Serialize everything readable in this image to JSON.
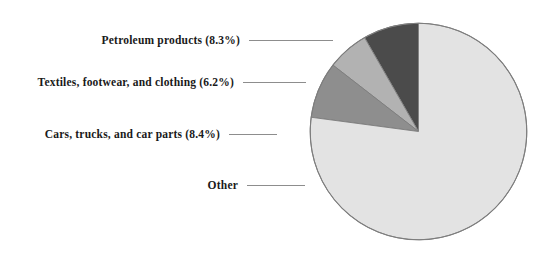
{
  "chart_data": {
    "type": "pie",
    "title": "",
    "subtitle": "",
    "xlabel": "",
    "ylabel": "",
    "legend_position": "left-labels-with-leader-lines",
    "grid": false,
    "start_angle_deg": 90,
    "direction": "counterclockwise",
    "categories": [
      "Petroleum products",
      "Textiles, footwear, and clothing",
      "Cars, trucks, and car parts",
      "Other"
    ],
    "values": [
      8.3,
      6.2,
      8.4,
      77.1
    ],
    "units": "percent",
    "slices": [
      {
        "name": "Petroleum products",
        "label": "Petroleum products (8.3%)",
        "value": 8.3,
        "value_text": "8.3%",
        "color": "#4b4b4b"
      },
      {
        "name": "Textiles, footwear, and clothing",
        "label": "Textiles, footwear, and clothing (6.2%)",
        "value": 6.2,
        "value_text": "6.2%",
        "color": "#b2b2b2"
      },
      {
        "name": "Cars, trucks, and car parts",
        "label": "Cars, trucks, and car parts (8.4%)",
        "value": 8.4,
        "value_text": "8.4%",
        "color": "#8e8e8e"
      },
      {
        "name": "Other",
        "label": "Other",
        "value": 77.1,
        "value_text": "",
        "color": "#e3e3e3"
      }
    ],
    "colors": {
      "petroleum": "#4b4b4b",
      "textiles": "#b2b2b2",
      "cars": "#8e8e8e",
      "other": "#e3e3e3",
      "outline": "#7d7d7d",
      "leader_line": "#8d8d8d",
      "label_text": "#1a1a1a",
      "background": "#ffffff"
    }
  },
  "labels": {
    "petroleum": "Petroleum products (8.3%)",
    "textiles": "Textiles, footwear, and clothing (6.2%)",
    "cars": "Cars, trucks, and car parts (8.4%)",
    "other": "Other"
  }
}
